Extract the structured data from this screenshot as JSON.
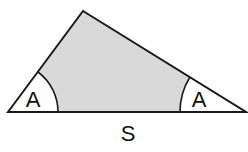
{
  "diagram": {
    "type": "geometry-triangle",
    "colors": {
      "background": "#ffffff",
      "fill": "#d9d9d9",
      "stroke": "#1a1a1a",
      "text": "#111111"
    },
    "vertices": {
      "left": [
        8,
        112
      ],
      "apex": [
        83,
        11
      ],
      "right": [
        246,
        112
      ]
    },
    "angle_labels": [
      {
        "id": "left-angle",
        "text": "A",
        "x": 33,
        "y": 107,
        "arc_radius": 50
      },
      {
        "id": "right-angle",
        "text": "A",
        "x": 198,
        "y": 107,
        "arc_radius": 66
      }
    ],
    "side_label": {
      "text": "S",
      "x": 128,
      "y": 141
    }
  }
}
